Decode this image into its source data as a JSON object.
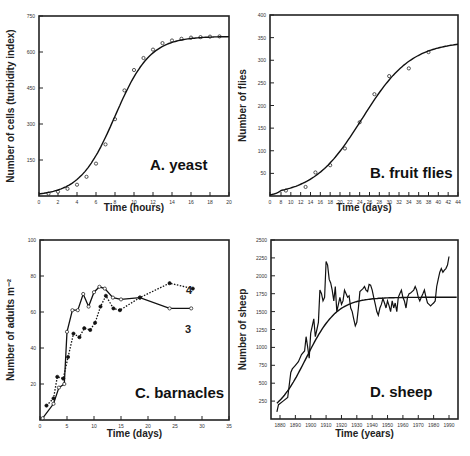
{
  "chart_data": [
    {
      "id": "A",
      "type": "scatter",
      "title": "A. yeast",
      "xlabel": "Time (hours)",
      "ylabel": "Number of cells (turbidity index)",
      "xlim": [
        0,
        20
      ],
      "ylim": [
        0,
        750
      ],
      "xticks": [
        0,
        2,
        4,
        6,
        8,
        10,
        12,
        14,
        16,
        18,
        20
      ],
      "yticks": [
        150,
        300,
        450,
        600,
        750
      ],
      "grid": false,
      "series": [
        {
          "name": "observed",
          "marker": "open-circle",
          "x": [
            1,
            2,
            3,
            4,
            5,
            6,
            7,
            8,
            9,
            10,
            11,
            12,
            13,
            14,
            15,
            16,
            17,
            18,
            19
          ],
          "y": [
            10,
            18,
            30,
            47,
            80,
            135,
            215,
            320,
            440,
            525,
            575,
            610,
            637,
            648,
            655,
            660,
            662,
            664,
            665
          ]
        },
        {
          "name": "logistic fit",
          "style": "line",
          "K": 665,
          "r": 0.54,
          "t0": 8
        }
      ]
    },
    {
      "id": "B",
      "type": "scatter",
      "title": "B. fruit flies",
      "xlabel": "Time (days)",
      "ylabel": "Number of flies",
      "xlim": [
        0,
        44
      ],
      "ylim": [
        0,
        400
      ],
      "xticks": [
        0,
        8,
        10,
        12,
        14,
        16,
        18,
        20,
        22,
        24,
        26,
        28,
        30,
        32,
        34,
        36,
        38,
        40,
        42,
        44
      ],
      "yticks": [
        50,
        100,
        150,
        200,
        250,
        300,
        350,
        400
      ],
      "grid": false,
      "series": [
        {
          "name": "observed",
          "marker": "open-circle",
          "x": [
            9,
            13,
            15,
            18,
            21,
            24,
            27,
            30,
            34,
            38
          ],
          "y": [
            12,
            20,
            52,
            68,
            105,
            163,
            225,
            265,
            282,
            318
          ]
        },
        {
          "name": "logistic fit",
          "style": "line",
          "K": 342,
          "r": 0.2,
          "t0": 24.5
        }
      ]
    },
    {
      "id": "C",
      "type": "line",
      "title": "C. barnacles",
      "xlabel": "Time (days)",
      "ylabel": "Number of adults m⁻²",
      "xlim": [
        0,
        35
      ],
      "ylim": [
        0,
        100
      ],
      "xticks": [
        0,
        5,
        10,
        15,
        20,
        25,
        30,
        35
      ],
      "yticks": [
        20,
        40,
        60,
        80,
        100
      ],
      "grid": false,
      "series": [
        {
          "name": "3",
          "style": "solid",
          "marker": "open-circle",
          "x": [
            0.5,
            2.5,
            3.5,
            4.5,
            5,
            6,
            7,
            8,
            9,
            10,
            11,
            12,
            13.5,
            15,
            18.5,
            24,
            28
          ],
          "y": [
            1,
            9,
            18,
            20,
            49,
            61,
            61,
            70,
            63,
            71,
            74,
            73,
            68,
            67,
            68,
            62,
            62
          ]
        },
        {
          "name": "4",
          "style": "dotted",
          "marker": "filled-circle",
          "x": [
            1.2,
            2.5,
            3.2,
            4.3,
            5.2,
            6.2,
            7.3,
            8.2,
            9.3,
            10.2,
            11.2,
            12.2,
            13.6,
            14.8,
            18.5,
            24,
            28.3
          ],
          "y": [
            8,
            12,
            24,
            23,
            35,
            48,
            46,
            51,
            50,
            54,
            63,
            69,
            62,
            61,
            68,
            76,
            73
          ]
        }
      ]
    },
    {
      "id": "D",
      "type": "line",
      "title": "D. sheep",
      "xlabel": "Time (years)",
      "ylabel": "Number of sheep",
      "xlim": [
        1874,
        1996
      ],
      "ylim": [
        0,
        2500
      ],
      "xticks": [
        1880,
        1890,
        1900,
        1910,
        1920,
        1930,
        1940,
        1950,
        1960,
        1970,
        1980,
        1990
      ],
      "yticks": [
        250,
        500,
        750,
        1000,
        1250,
        1500,
        1750,
        2000,
        2250,
        2500
      ],
      "grid": false,
      "series": [
        {
          "name": "observed",
          "style": "solid",
          "x": [
            1878,
            1879,
            1882,
            1885,
            1887,
            1888,
            1890,
            1892,
            1894,
            1896,
            1897,
            1898,
            1899,
            1900,
            1901,
            1902,
            1903,
            1904,
            1905,
            1906,
            1907,
            1908,
            1909,
            1910,
            1911,
            1912,
            1913,
            1914,
            1915,
            1916,
            1917,
            1918,
            1919,
            1920,
            1921,
            1922,
            1923,
            1924,
            1925,
            1926,
            1927,
            1928,
            1929,
            1930,
            1931,
            1932,
            1933,
            1934,
            1935,
            1936,
            1937,
            1938,
            1939,
            1940,
            1941,
            1942,
            1943,
            1944,
            1945,
            1946,
            1947,
            1948,
            1949,
            1950,
            1951,
            1952,
            1953,
            1954,
            1955,
            1956,
            1957,
            1958,
            1959,
            1960,
            1961,
            1962,
            1963,
            1964,
            1965,
            1966,
            1967,
            1968,
            1969,
            1970,
            1971,
            1972,
            1973,
            1974,
            1975,
            1976,
            1977,
            1978,
            1979,
            1980,
            1981,
            1982,
            1983,
            1984,
            1985,
            1986,
            1987,
            1988,
            1989,
            1990,
            1991,
            1992,
            1993,
            1994
          ],
          "y": [
            100,
            200,
            250,
            300,
            650,
            700,
            750,
            800,
            900,
            950,
            1150,
            1000,
            850,
            1200,
            1300,
            1400,
            1150,
            1250,
            1350,
            1800,
            1750,
            1650,
            1700,
            2200,
            2150,
            1950,
            1900,
            1800,
            1650,
            1850,
            1500,
            1600,
            1700,
            1600,
            1650,
            1800,
            1750,
            1700,
            1720,
            1550,
            1500,
            1400,
            1300,
            1350,
            1550,
            1780,
            1800,
            1820,
            1850,
            1800,
            1780,
            1880,
            1870,
            1800,
            1700,
            1600,
            1500,
            1450,
            1550,
            1600,
            1680,
            1620,
            1550,
            1650,
            1580,
            1500,
            1650,
            1550,
            1620,
            1500,
            1700,
            1750,
            1800,
            1700,
            1650,
            1550,
            1700,
            1750,
            1760,
            1780,
            1800,
            1850,
            1800,
            1700,
            1650,
            1700,
            1750,
            1800,
            1700,
            1620,
            1600,
            1580,
            1600,
            1620,
            1650,
            1850,
            1950,
            2050,
            2100,
            2050,
            2080,
            2100,
            2150,
            2270
          ]
        },
        {
          "name": "logistic fit",
          "style": "line",
          "K": 1700,
          "r": 0.1,
          "t0": 1897
        }
      ]
    }
  ]
}
